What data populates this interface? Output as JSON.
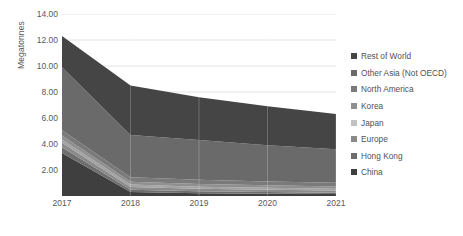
{
  "chart_data": {
    "type": "area",
    "stacked": true,
    "title": "",
    "subtitle": "",
    "xlabel": "",
    "ylabel": "Megatonnes",
    "categories": [
      "2017",
      "2018",
      "2019",
      "2020",
      "2021"
    ],
    "x": [
      2017,
      2018,
      2019,
      2020,
      2021
    ],
    "ylim": [
      0,
      14
    ],
    "y_ticks": [
      "2.00",
      "4.00",
      "6.00",
      "8.00",
      "10.00",
      "12.00",
      "14.00"
    ],
    "y_tick_values": [
      2,
      4,
      6,
      8,
      10,
      12,
      14
    ],
    "grid": true,
    "grid_axis": "y",
    "legend_position": "right",
    "series": [
      {
        "name": "China",
        "color": "#3f3f3f",
        "values": [
          3.3,
          0.3,
          0.22,
          0.18,
          0.15
        ]
      },
      {
        "name": "Hong Kong",
        "color": "#6e6e6e",
        "values": [
          0.45,
          0.18,
          0.14,
          0.12,
          0.1
        ]
      },
      {
        "name": "Europe",
        "color": "#8a8a8a",
        "values": [
          0.35,
          0.22,
          0.2,
          0.18,
          0.17
        ]
      },
      {
        "name": "Japan",
        "color": "#a3a3a3",
        "values": [
          0.25,
          0.18,
          0.16,
          0.15,
          0.14
        ]
      },
      {
        "name": "Korea",
        "color": "#8f8f8f",
        "values": [
          0.3,
          0.22,
          0.2,
          0.19,
          0.18
        ]
      },
      {
        "name": "North America",
        "color": "#7a7a7a",
        "values": [
          0.4,
          0.35,
          0.33,
          0.3,
          0.28
        ]
      },
      {
        "name": "Other Asia (Not OECD)",
        "color": "#6a6a6a",
        "values": [
          4.85,
          3.25,
          3.05,
          2.78,
          2.58
        ]
      },
      {
        "name": "Rest of World",
        "color": "#454545",
        "values": [
          2.4,
          3.8,
          3.3,
          3.0,
          2.7
        ]
      }
    ],
    "totals": [
      12.3,
      8.5,
      7.6,
      6.9,
      6.3
    ]
  },
  "axis": {
    "y_title": "Megatonnes"
  },
  "legend": {
    "items": [
      {
        "label": "Rest of World",
        "color": "#454545"
      },
      {
        "label": "Other Asia (Not OECD)",
        "color": "#6a6a6a"
      },
      {
        "label": "North America",
        "color": "#7a7a7a"
      },
      {
        "label": "Korea",
        "color": "#8f8f8f"
      },
      {
        "label": "Japan",
        "color": "#c2c2c2"
      },
      {
        "label": "Europe",
        "color": "#8a8a8a"
      },
      {
        "label": "Hong Kong",
        "color": "#6e6e6e"
      },
      {
        "label": "China",
        "color": "#3f3f3f"
      }
    ]
  },
  "style": {
    "gridline_color": "#e4e4e4",
    "axis_text_color": "#595959",
    "background": "#ffffff"
  }
}
